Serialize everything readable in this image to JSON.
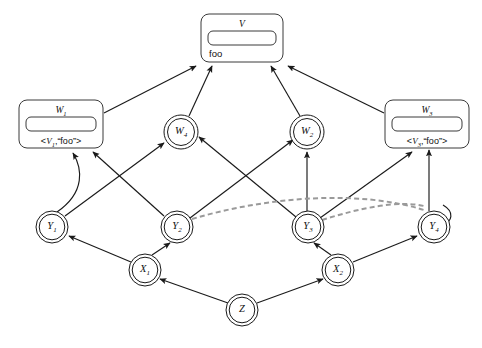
{
  "diagram": {
    "background_color": "#ffffff",
    "edge_color": "#1a1a1a",
    "dashed_edge_color": "#9a9a9a",
    "node_fill": "#ffffff",
    "node_stroke": "#1a1a1a"
  },
  "box_nodes": [
    {
      "id": "V",
      "title": "V",
      "title_sub": "",
      "content_prefix": "",
      "content_var": "",
      "content_sub": "",
      "content_suffix": "",
      "footer": "foo",
      "x": 201,
      "y": 14,
      "w": 82,
      "h": 48
    },
    {
      "id": "W1",
      "title": "W",
      "title_sub": "1",
      "content_prefix": "<",
      "content_var": "V",
      "content_sub": "1",
      "content_suffix": ",“foo”>",
      "footer": "",
      "x": 19,
      "y": 100,
      "w": 84,
      "h": 48
    },
    {
      "id": "W3",
      "title": "W",
      "title_sub": "3",
      "content_prefix": "<",
      "content_var": "V",
      "content_sub": "3",
      "content_suffix": ",“foo”>",
      "footer": "",
      "x": 385,
      "y": 100,
      "w": 84,
      "h": 48
    }
  ],
  "circle_nodes": [
    {
      "id": "W4",
      "label": "W",
      "sub": "4",
      "cx": 181,
      "cy": 132,
      "r": 17
    },
    {
      "id": "W2",
      "label": "W",
      "sub": "2",
      "cx": 307,
      "cy": 132,
      "r": 17
    },
    {
      "id": "Y1",
      "label": "Y",
      "sub": "1",
      "cx": 52,
      "cy": 227,
      "r": 16
    },
    {
      "id": "Y2",
      "label": "Y",
      "sub": "2",
      "cx": 177,
      "cy": 227,
      "r": 16
    },
    {
      "id": "Y3",
      "label": "Y",
      "sub": "3",
      "cx": 308,
      "cy": 227,
      "r": 16
    },
    {
      "id": "Y4",
      "label": "Y",
      "sub": "4",
      "cx": 434,
      "cy": 227,
      "r": 16
    },
    {
      "id": "X1",
      "label": "X",
      "sub": "1",
      "cx": 145,
      "cy": 270,
      "r": 16
    },
    {
      "id": "X2",
      "label": "X",
      "sub": "2",
      "cx": 338,
      "cy": 270,
      "r": 16
    },
    {
      "id": "Z",
      "label": "Z",
      "sub": "",
      "cx": 242,
      "cy": 310,
      "r": 16
    }
  ],
  "edges": [
    {
      "from": "W1",
      "to": "V",
      "style": "solid"
    },
    {
      "from": "W4",
      "to": "V",
      "style": "solid"
    },
    {
      "from": "W2",
      "to": "V",
      "style": "solid"
    },
    {
      "from": "W3",
      "to": "V",
      "style": "solid"
    },
    {
      "from": "Y1",
      "to": "W1",
      "style": "solid-curved"
    },
    {
      "from": "Y2",
      "to": "W1",
      "style": "solid"
    },
    {
      "from": "Y1",
      "to": "W4",
      "style": "solid"
    },
    {
      "from": "Y3",
      "to": "W4",
      "style": "solid"
    },
    {
      "from": "Y2",
      "to": "W2",
      "style": "solid"
    },
    {
      "from": "Y3",
      "to": "W2",
      "style": "solid"
    },
    {
      "from": "Y4",
      "to": "W3",
      "style": "solid"
    },
    {
      "from": "Y3",
      "to": "W3",
      "style": "solid"
    },
    {
      "from": "Y2",
      "to": "Y4",
      "style": "dashed-curved"
    },
    {
      "from": "Y3",
      "to": "Y4",
      "style": "dashed"
    },
    {
      "from": "X1",
      "to": "Y1",
      "style": "solid"
    },
    {
      "from": "X1",
      "to": "Y2",
      "style": "solid"
    },
    {
      "from": "X2",
      "to": "Y3",
      "style": "solid"
    },
    {
      "from": "X2",
      "to": "Y4",
      "style": "solid"
    },
    {
      "from": "Z",
      "to": "X1",
      "style": "solid"
    },
    {
      "from": "Z",
      "to": "X2",
      "style": "solid"
    }
  ]
}
